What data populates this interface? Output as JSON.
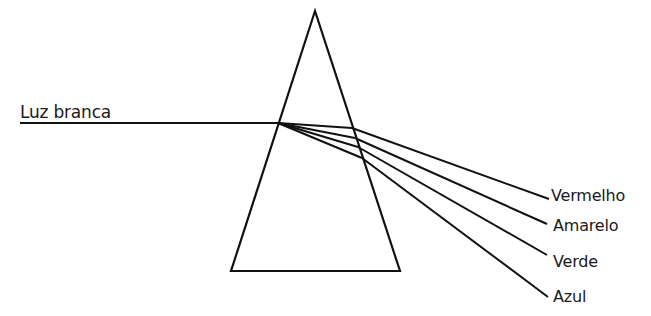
{
  "diagram": {
    "type": "prism-dispersion",
    "incident_light": {
      "label": "Luz branca"
    },
    "prism": {
      "shape": "triangle",
      "apex": [
        315,
        11
      ],
      "base_left": [
        231,
        271
      ],
      "base_right": [
        400,
        271
      ]
    },
    "dispersed_rays": [
      {
        "label": "Vermelho"
      },
      {
        "label": "Amarelo"
      },
      {
        "label": "Verde"
      },
      {
        "label": "Azul"
      }
    ],
    "colors": {
      "line": "#111111",
      "text": "#1a1a1a",
      "background": "#ffffff"
    }
  }
}
